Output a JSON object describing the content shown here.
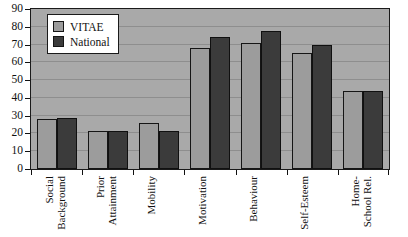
{
  "chart_data": {
    "type": "bar",
    "title": "",
    "xlabel": "",
    "ylabel": "",
    "ylim": [
      0,
      90
    ],
    "ytick_step": 10,
    "yticks": [
      0,
      10,
      20,
      30,
      40,
      50,
      60,
      70,
      80,
      90
    ],
    "grid": true,
    "legend_position": "top-left inside plot",
    "categories": [
      "Social Background",
      "Prior Attainment",
      "Mobility",
      "Motivation",
      "Behaviour",
      "Self-Esteem",
      "Home-School Rel."
    ],
    "category_label_lines": [
      "Social\nBackground",
      "Prior\nAttainment",
      "Mobility",
      "Motivation",
      "Behaviour",
      "Self-Esteem",
      "Home-\nSchool Rel."
    ],
    "series": [
      {
        "name": "VITAE",
        "color": "#9c9c9c",
        "values": [
          28,
          21.5,
          26,
          68,
          71,
          65,
          44
        ]
      },
      {
        "name": "National",
        "color": "#3b3b3b",
        "values": [
          28.5,
          21.5,
          21.5,
          74,
          77.5,
          70,
          44
        ]
      }
    ]
  },
  "legend": {
    "items": [
      {
        "label": "VITAE",
        "swatch": "vitae"
      },
      {
        "label": "National",
        "swatch": "national"
      }
    ]
  },
  "colors": {
    "plot_background": "#a9a9a9",
    "gridline": "#8e8e8e",
    "axis": "#1a1a1a",
    "vitae": "#9c9c9c",
    "national": "#3b3b3b",
    "page_background": "#ffffff"
  }
}
